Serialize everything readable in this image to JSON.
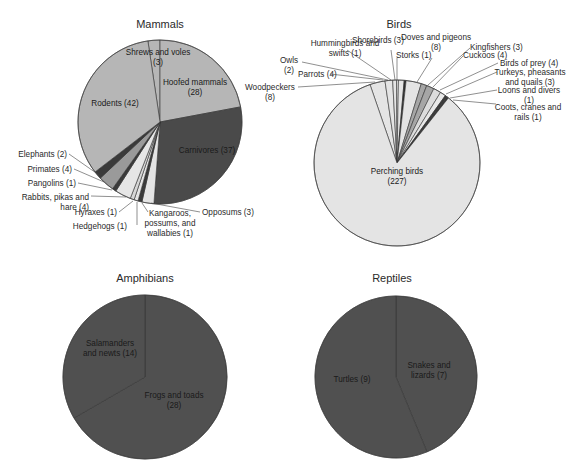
{
  "chart_data": [
    {
      "type": "pie",
      "title": "Mammals",
      "center": [
        160,
        122
      ],
      "radius": 82,
      "start_angle_deg": -8.5,
      "slices": [
        {
          "label": "Shrews and voles",
          "value": 3,
          "color": "#b6b6b6"
        },
        {
          "label": "Hoofed mammals",
          "value": 28,
          "color": "#b6b6b6"
        },
        {
          "label": "Carnivores",
          "value": 37,
          "color": "#4a4a4a"
        },
        {
          "label": "Opossums",
          "value": 3,
          "color": "#e4e4e4"
        },
        {
          "label": "Kangaroos, possums, and wallabies",
          "value": 1,
          "color": "#3a3a3a"
        },
        {
          "label": "Hedgehogs",
          "value": 1,
          "color": "#e4e4e4"
        },
        {
          "label": "Hyraxes",
          "value": 1,
          "color": "#d6d6d6"
        },
        {
          "label": "Rabbits, pikas and hare",
          "value": 4,
          "color": "#e6e6e6"
        },
        {
          "label": "Pangolins",
          "value": 1,
          "color": "#3a3a3a"
        },
        {
          "label": "Primates",
          "value": 4,
          "color": "#9a9a9a"
        },
        {
          "label": "Elephants",
          "value": 2,
          "color": "#3a3a3a"
        },
        {
          "label": "Rodents",
          "value": 42,
          "color": "#b6b6b6"
        }
      ],
      "inside_labels": [
        {
          "lines": [
            "Shrews and voles",
            "(3)"
          ],
          "x": 158,
          "y": 55
        },
        {
          "lines": [
            "Hoofed mammals",
            "(28)"
          ],
          "x": 195,
          "y": 85
        },
        {
          "lines": [
            "Rodents (42)"
          ],
          "x": 115,
          "y": 106
        },
        {
          "lines": [
            "Carnivores (37)"
          ],
          "x": 207,
          "y": 153
        }
      ],
      "callouts": [
        {
          "lines": [
            "Elephants (2)"
          ],
          "tx": 67,
          "ty": 157,
          "anchor": "end",
          "lx1": 69,
          "ly1": 154,
          "lx2": 99,
          "ly2": 175
        },
        {
          "lines": [
            "Primates (4)"
          ],
          "tx": 72,
          "ty": 172,
          "anchor": "end",
          "lx1": 74,
          "ly1": 169,
          "lx2": 104,
          "ly2": 182
        },
        {
          "lines": [
            "Pangolins (1)"
          ],
          "tx": 76,
          "ty": 186,
          "anchor": "end",
          "lx1": 78,
          "ly1": 183,
          "lx2": 112,
          "ly2": 190
        },
        {
          "lines": [
            "Rabbits, pikas and",
            "hare (4)"
          ],
          "tx": 89,
          "ty": 200,
          "anchor": "end",
          "lx1": 91,
          "ly1": 196,
          "lx2": 126,
          "ly2": 197
        },
        {
          "lines": [
            "Hyraxes (1)"
          ],
          "tx": 117,
          "ty": 215,
          "anchor": "end",
          "lx1": 119,
          "ly1": 212,
          "lx2": 133,
          "ly2": 201
        },
        {
          "lines": [
            "Hedgehogs (1)"
          ],
          "tx": 127,
          "ty": 229,
          "anchor": "end",
          "lx1": 137,
          "ly1": 225,
          "lx2": 137,
          "ly2": 202
        },
        {
          "lines": [
            "Kangaroos,",
            "possums, and",
            "wallabies (1)"
          ],
          "tx": 170,
          "ty": 216,
          "anchor": "middle",
          "lx1": 148,
          "ly1": 212,
          "lx2": 142,
          "ly2": 203
        },
        {
          "lines": [
            "Opposums (3)"
          ],
          "tx": 202,
          "ty": 215,
          "anchor": "start",
          "lx1": 200,
          "ly1": 212,
          "lx2": 151,
          "ly2": 203
        }
      ]
    },
    {
      "type": "pie",
      "title": "Birds",
      "center": [
        397,
        163
      ],
      "radius": 83,
      "start_angle_deg": -19,
      "slices": [
        {
          "label": "Woodpeckers",
          "value": 8,
          "color": "#e4e4e4"
        },
        {
          "label": "Parrots",
          "value": 4,
          "color": "#e4e4e4"
        },
        {
          "label": "Owls",
          "value": 2,
          "color": "#e4e4e4"
        },
        {
          "label": "Hummingbirds and swifts",
          "value": 1,
          "color": "#e4e4e4"
        },
        {
          "label": "Shorebirds",
          "value": 3,
          "color": "#e4e4e4"
        },
        {
          "label": "Storks",
          "value": 1,
          "color": "#2e2e2e"
        },
        {
          "label": "Doves and pigeons",
          "value": 8,
          "color": "#e4e4e4"
        },
        {
          "label": "Kingfishers",
          "value": 3,
          "color": "#a6a6a6"
        },
        {
          "label": "Cuckoos",
          "value": 4,
          "color": "#a6a6a6"
        },
        {
          "label": "Birds of prey",
          "value": 4,
          "color": "#dcdcdc"
        },
        {
          "label": "Turkeys, pheasants and quails",
          "value": 3,
          "color": "#e8e8e8"
        },
        {
          "label": "Loons and divers",
          "value": 1,
          "color": "#3a3a3a"
        },
        {
          "label": "Coots, cranes and rails",
          "value": 1,
          "color": "#3a3a3a"
        },
        {
          "label": "Perching birds",
          "value": 227,
          "color": "#e4e4e4"
        }
      ],
      "inside_labels": [
        {
          "lines": [
            "Perching birds",
            "(227)"
          ],
          "x": 397,
          "y": 174
        }
      ],
      "callouts": [
        {
          "lines": [
            "Hummingbirds and",
            "swifts (1)"
          ],
          "tx": 345,
          "ty": 46,
          "anchor": "middle",
          "lx1": 347,
          "ly1": 50,
          "lx2": 391,
          "ly2": 80
        },
        {
          "lines": [
            "Owls",
            "(2)"
          ],
          "tx": 289,
          "ty": 63,
          "anchor": "middle",
          "lx1": 302,
          "ly1": 62,
          "lx2": 388,
          "ly2": 80
        },
        {
          "lines": [
            "Parrots (4)"
          ],
          "tx": 298,
          "ty": 77,
          "anchor": "start",
          "lx1": 330,
          "ly1": 74,
          "lx2": 383,
          "ly2": 80
        },
        {
          "lines": [
            "Woodpeckers",
            "(8)"
          ],
          "tx": 270,
          "ty": 90,
          "anchor": "middle",
          "lx1": 298,
          "ly1": 87,
          "lx2": 375,
          "ly2": 82
        },
        {
          "lines": [
            "Shorebirds (3)"
          ],
          "tx": 352,
          "ty": 43,
          "anchor": "start",
          "lx1": 391,
          "ly1": 50,
          "lx2": 395,
          "ly2": 80
        },
        {
          "lines": [
            "Storks (1)"
          ],
          "tx": 396,
          "ty": 58,
          "anchor": "start",
          "lx1": 397,
          "ly1": 58,
          "lx2": 397,
          "ly2": 80
        },
        {
          "lines": [
            "Doves and pigeons",
            "(8)"
          ],
          "tx": 436,
          "ty": 40,
          "anchor": "middle",
          "lx1": 432,
          "ly1": 58,
          "lx2": 417,
          "ly2": 82
        },
        {
          "lines": [
            "Kingfishers (3)"
          ],
          "tx": 470,
          "ty": 50,
          "anchor": "start",
          "lx1": 470,
          "ly1": 48,
          "lx2": 428,
          "ly2": 85
        },
        {
          "lines": [
            "Cuckoos (4)"
          ],
          "tx": 463,
          "ty": 58,
          "anchor": "start",
          "lx1": 463,
          "ly1": 56,
          "lx2": 433,
          "ly2": 87
        },
        {
          "lines": [
            "Birds of prey (4)"
          ],
          "tx": 500,
          "ty": 66,
          "anchor": "start",
          "lx1": 498,
          "ly1": 63,
          "lx2": 440,
          "ly2": 90
        },
        {
          "lines": [
            "Turkeys, pheasants",
            "and quails (3)"
          ],
          "tx": 530,
          "ty": 75,
          "anchor": "middle",
          "lx1": 497,
          "ly1": 72,
          "lx2": 446,
          "ly2": 94
        },
        {
          "lines": [
            "Loons and divers",
            "(1)"
          ],
          "tx": 529,
          "ty": 93,
          "anchor": "middle",
          "lx1": 497,
          "ly1": 90,
          "lx2": 450,
          "ly2": 98
        },
        {
          "lines": [
            "Coots, cranes and",
            "rails (1)"
          ],
          "tx": 528,
          "ty": 110,
          "anchor": "middle",
          "lx1": 496,
          "ly1": 104,
          "lx2": 453,
          "ly2": 100
        }
      ]
    },
    {
      "type": "pie",
      "title": "Amphibians",
      "center": [
        145,
        377
      ],
      "radius": 82,
      "start_angle_deg": 0,
      "slices": [
        {
          "label": "Frogs and toads",
          "value": 28,
          "color": "#505050"
        },
        {
          "label": "Salamanders and newts",
          "value": 14,
          "color": "#505050"
        }
      ],
      "inside_labels": [
        {
          "lines": [
            "Salamanders",
            "and newts (14)"
          ],
          "x": 110,
          "y": 346
        },
        {
          "lines": [
            "Frogs and toads",
            "(28)"
          ],
          "x": 174,
          "y": 398
        }
      ],
      "callouts": []
    },
    {
      "type": "pie",
      "title": "Reptiles",
      "center": [
        396,
        377
      ],
      "radius": 81,
      "start_angle_deg": 0,
      "slices": [
        {
          "label": "Snakes and lizards",
          "value": 7,
          "color": "#505050"
        },
        {
          "label": "Turtles",
          "value": 9,
          "color": "#505050"
        }
      ],
      "inside_labels": [
        {
          "lines": [
            "Snakes and",
            "lizards (7)"
          ],
          "x": 429,
          "y": 368
        },
        {
          "lines": [
            "Turtles (9)"
          ],
          "x": 352,
          "y": 382
        }
      ],
      "callouts": []
    }
  ],
  "charts": {
    "mammals": {
      "title": "Mammals"
    },
    "birds": {
      "title": "Birds"
    },
    "amphibians": {
      "title": "Amphibians"
    },
    "reptiles": {
      "title": "Reptiles"
    }
  },
  "titles": [
    {
      "key": "mammals",
      "x": 160,
      "y": 28
    },
    {
      "key": "birds",
      "x": 399,
      "y": 28
    },
    {
      "key": "amphibians",
      "x": 145,
      "y": 282
    },
    {
      "key": "reptiles",
      "x": 392,
      "y": 282
    }
  ]
}
